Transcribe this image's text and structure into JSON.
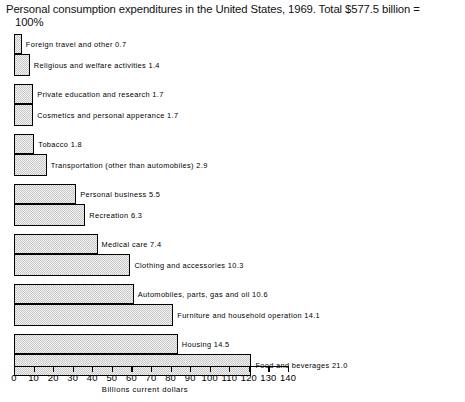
{
  "chart_data": {
    "type": "bar",
    "orientation": "horizontal",
    "title_line1": "Personal consumption expenditures in the United States, 1969. Total $577.5 billion =",
    "title_line2": "100%",
    "xlabel": "Billions current dollars",
    "ylabel": "",
    "xlim": [
      0,
      140
    ],
    "xticks": [
      0,
      10,
      20,
      30,
      40,
      50,
      60,
      70,
      80,
      90,
      100,
      110,
      120,
      130,
      140
    ],
    "xticklabels": [
      "0",
      "10",
      "20",
      "30",
      "40",
      "50",
      "60",
      "70",
      "80",
      "90",
      "100",
      "110",
      "120",
      "130",
      "140"
    ],
    "grid": false,
    "legend": false,
    "units_note": "Bar lengths are billions of current dollars; label numbers are percent of total",
    "categories": [
      "Foreign travel and other",
      "Religious and welfare activities",
      "Private education and research",
      "Cosmetics and personal apperance",
      "Tobacco",
      "Transportation (other than automobiles)",
      "Personal business",
      "Recreation",
      "Medical care",
      "Clothing and accessories",
      "Automobiles, parts, gas and oil",
      "Furniture and household operation",
      "Housing",
      "Food and beverages"
    ],
    "percent_values": [
      0.7,
      1.4,
      1.7,
      1.7,
      1.8,
      2.9,
      5.5,
      6.3,
      7.4,
      10.3,
      10.6,
      14.1,
      14.5,
      21.0
    ],
    "values": [
      4.0,
      8.1,
      9.8,
      9.8,
      10.4,
      16.7,
      31.8,
      36.4,
      42.7,
      59.5,
      61.2,
      81.4,
      83.7,
      121.3
    ],
    "bars": [
      {
        "label": "Foreign travel and other 0.7",
        "percent": 0.7,
        "value": 4.0
      },
      {
        "label": "Religious and welfare activities 1.4",
        "percent": 1.4,
        "value": 8.1
      },
      {
        "label": "Private education and research 1.7",
        "percent": 1.7,
        "value": 9.8
      },
      {
        "label": "Cosmetics and personal apperance 1.7",
        "percent": 1.7,
        "value": 9.8
      },
      {
        "label": "Tobacco 1.8",
        "percent": 1.8,
        "value": 10.4
      },
      {
        "label": "Transportation (other than automobiles) 2.9",
        "percent": 2.9,
        "value": 16.7
      },
      {
        "label": "Personal business 5.5",
        "percent": 5.5,
        "value": 31.8
      },
      {
        "label": "Recreation 6.3",
        "percent": 6.3,
        "value": 36.4
      },
      {
        "label": "Medical care 7.4",
        "percent": 7.4,
        "value": 42.7
      },
      {
        "label": "Clothing and accessories 10.3",
        "percent": 10.3,
        "value": 59.5
      },
      {
        "label": "Automobiles, parts, gas and oil 10.6",
        "percent": 10.6,
        "value": 61.2
      },
      {
        "label": "Furniture and household operation 14.1",
        "percent": 14.1,
        "value": 81.4
      },
      {
        "label": "Housing 14.5",
        "percent": 14.5,
        "value": 83.7
      },
      {
        "label": "Food and beverages 21.0",
        "percent": 21.0,
        "value": 121.3
      }
    ]
  },
  "style": {
    "bar_fill": "#c9c9c9",
    "bar_edge": "#000000",
    "text_color": "#000000",
    "background": "#ffffff"
  }
}
